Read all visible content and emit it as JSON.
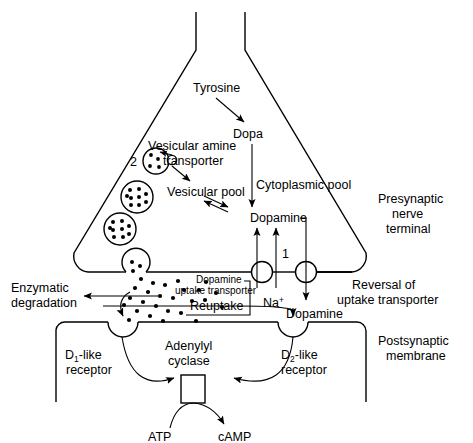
{
  "figure": {
    "type": "biological-pathway-diagram"
  },
  "labels": {
    "tyrosine": "Tyrosine",
    "dopa": "Dopa",
    "vesicular_amine_transporter_l1": "Vesicular amine",
    "vesicular_amine_transporter_l2": "transporter",
    "vesicle_marker": "2",
    "vesicular_pool": "Vesicular pool",
    "cytoplasmic_pool": "Cytoplasmic pool",
    "dopamine_cytoplasmic": "Dopamine",
    "presynaptic_l1": "Presynaptic",
    "presynaptic_l2": "nerve",
    "presynaptic_l3": "terminal",
    "transporter_marker": "1",
    "sodium_ion": "Na",
    "sodium_charge": "+",
    "dopamine_uptake_l1": "Dopamine",
    "dopamine_uptake_l2": "uptake transporter",
    "reuptake": "Reuptake",
    "reversal_l1": "Reversal of",
    "reversal_l2": "uptake transporter",
    "dopamine_released": "Dopamine",
    "enzymatic_l1": "Enzymatic",
    "enzymatic_l2": "degradation",
    "d1_receptor_prefix": "D",
    "d1_receptor_sub": "1",
    "d1_receptor_l1": "-like",
    "d1_receptor_l2": "receptor",
    "d2_receptor_prefix": "D",
    "d2_receptor_sub": "2",
    "d2_receptor_l1": "-like",
    "d2_receptor_l2": "receptor",
    "adenylyl_l1": "Adenylyl",
    "adenylyl_l2": "cyclase",
    "atp": "ATP",
    "camp": "cAMP",
    "postsynaptic_l1": "Postsynaptic",
    "postsynaptic_l2": "membrane"
  },
  "colors": {
    "background": "#ffffff",
    "line": "#000000",
    "text": "#000000"
  }
}
